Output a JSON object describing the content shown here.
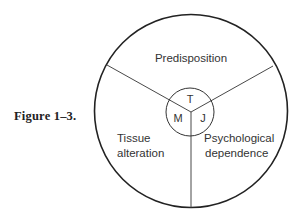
{
  "figure": {
    "caption": "Figure 1–3."
  },
  "diagram": {
    "outer_circle": {
      "cx": 191,
      "cy": 111,
      "r": 97
    },
    "inner_circle": {
      "cx": 190,
      "cy": 112,
      "r": 24
    },
    "segments": {
      "top": {
        "label": "Predisposition",
        "center_letter": "T"
      },
      "left": {
        "label_line1": "Tissue",
        "label_line2": "alteration",
        "center_letter": "M"
      },
      "right": {
        "label_line1": "Psychological",
        "label_line2": "dependence",
        "center_letter": "J"
      }
    },
    "stroke_color": "#222222"
  }
}
